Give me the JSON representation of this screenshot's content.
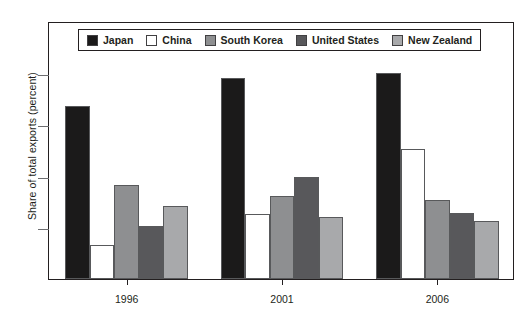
{
  "chart_data": {
    "type": "bar",
    "title": "",
    "xlabel": "",
    "ylabel": "Share of total exports (percent)",
    "categories": [
      "1996",
      "2001",
      "2006"
    ],
    "ylim": [
      0,
      25
    ],
    "yticks": [
      0,
      5,
      10,
      15,
      20,
      25
    ],
    "ytick_labels": [
      "0",
      "5",
      "10",
      "15",
      "20",
      "25"
    ],
    "grid": false,
    "legend_position": "top-inside",
    "series": [
      {
        "name": "Japan",
        "color": "#1b1a1a",
        "values": [
          16.8,
          19.5,
          20.0
        ]
      },
      {
        "name": "China",
        "color": "#ffffff",
        "values": [
          3.3,
          6.3,
          12.6
        ]
      },
      {
        "name": "South Korea",
        "color": "#8e8f91",
        "values": [
          9.1,
          8.0,
          7.7
        ]
      },
      {
        "name": "United States",
        "color": "#58585b",
        "values": [
          5.1,
          9.9,
          6.4
        ]
      },
      {
        "name": "New Zealand",
        "color": "#a8a9ab",
        "values": [
          7.1,
          6.0,
          5.6
        ]
      }
    ]
  },
  "colors": {
    "axis": "#231f20",
    "tick": "#6d6e71",
    "bar_outline": "#58595b",
    "background": "#ffffff"
  }
}
